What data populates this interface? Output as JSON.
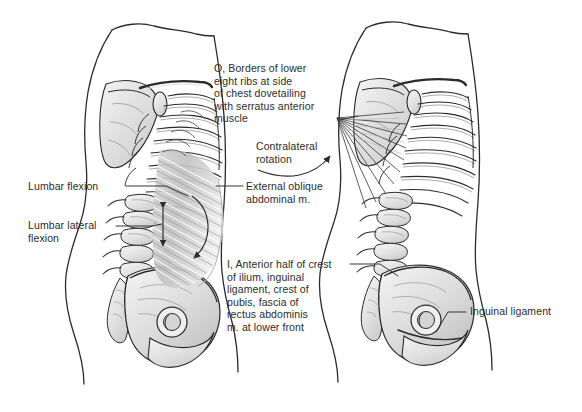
{
  "figure": {
    "background_color": "#ffffff",
    "ink_color": "#2b2b2b",
    "muscle_shading_color": "#c9c9c9",
    "bone_fill_color": "#e8e8e8"
  },
  "labels": {
    "origin": "O, Borders of lower\neight ribs at side\nof chest dovetailing\nwith serratus anterior\nmuscle",
    "contralateral_rotation": "Contralateral\nrotation",
    "external_oblique": "External oblique\nabdominal m.",
    "insertion": "I, Anterior half of crest\nof ilium, inguinal\nligament, crest of\npubis, fascia of\nrectus abdominis\nm. at lower front",
    "lumbar_flexion": "Lumbar flexion",
    "lumbar_lateral_flexion": "Lumbar lateral\nflexion",
    "inguinal_ligament": "Inguinal ligament"
  },
  "panels": {
    "left": {
      "name": "left-figure",
      "description": "Lateral view of torso with external oblique abdominal muscle shown in place over ribs, lumbar spine and pelvis",
      "shows_muscle": true
    },
    "right": {
      "name": "right-figure",
      "description": "Lateral view of torso skeleton with origin fan lines to lower eight ribs, muscle removed",
      "shows_muscle": false
    }
  }
}
